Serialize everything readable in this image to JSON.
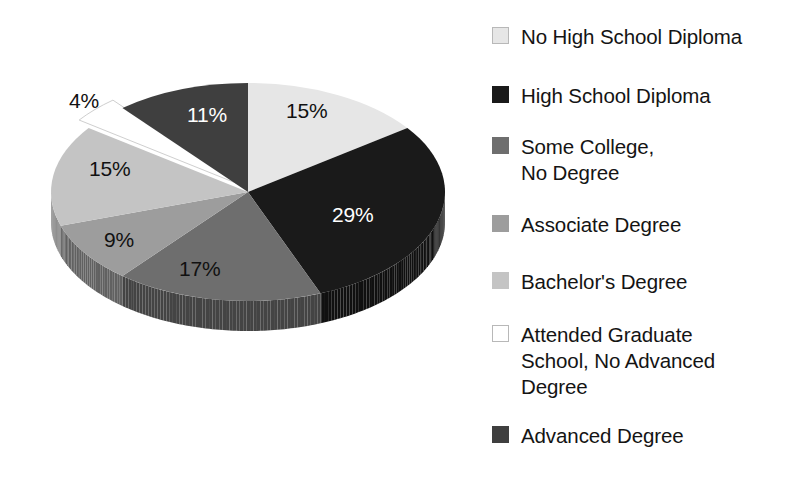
{
  "chart_data": {
    "type": "pie",
    "title": "",
    "subtitle": "",
    "xlabel": "",
    "ylabel": "",
    "grid": false,
    "legend_position": "right",
    "units": "percent",
    "start_angle_deg": 0,
    "direction": "clockwise",
    "three_d": true,
    "categories": [
      "No High School Diploma",
      "High School Diploma",
      "Some College,\nNo Degree",
      "Associate Degree",
      "Bachelor's Degree",
      "Attended Graduate\nSchool, No Advanced\nDegree",
      "Advanced Degree"
    ],
    "values": [
      15,
      29,
      17,
      9,
      15,
      4,
      11
    ],
    "data_labels": [
      "15%",
      "29%",
      "17%",
      "9%",
      "15%",
      "4%",
      "11%"
    ],
    "colors": [
      "#e6e6e6",
      "#1a1a1a",
      "#6e6e6e",
      "#9d9d9d",
      "#c4c4c4",
      "#ffffff",
      "#3f3f3f"
    ],
    "label_text_colors": [
      "#111111",
      "#ffffff",
      "#111111",
      "#111111",
      "#111111",
      "#111111",
      "#ffffff"
    ],
    "exploded_slices": [
      "Attended Graduate\nSchool, No Advanced\nDegree"
    ]
  },
  "pie": {
    "labels": [
      {
        "text": "15%",
        "x": 286,
        "y": 100,
        "tone": "dark"
      },
      {
        "text": "29%",
        "x": 332,
        "y": 204,
        "tone": "light"
      },
      {
        "text": "17%",
        "x": 179,
        "y": 258,
        "tone": "dark"
      },
      {
        "text": "9%",
        "x": 104,
        "y": 229,
        "tone": "dark"
      },
      {
        "text": "15%",
        "x": 89,
        "y": 158,
        "tone": "dark"
      },
      {
        "text": "4%",
        "x": 69,
        "y": 90,
        "tone": "dark"
      },
      {
        "text": "11%",
        "x": 187,
        "y": 104,
        "tone": "light"
      }
    ]
  },
  "legend": {
    "items": [
      {
        "label": "No High School Diploma",
        "color": "#e6e6e6",
        "outlined": true,
        "top": 24
      },
      {
        "label": "High School Diploma",
        "color": "#1a1a1a",
        "outlined": false,
        "top": 83
      },
      {
        "label": "Some College,\nNo Degree",
        "color": "#6e6e6e",
        "outlined": false,
        "top": 134
      },
      {
        "label": "Associate Degree",
        "color": "#9d9d9d",
        "outlined": false,
        "top": 212
      },
      {
        "label": "Bachelor's Degree",
        "color": "#c4c4c4",
        "outlined": false,
        "top": 269
      },
      {
        "label": "Attended Graduate\nSchool, No Advanced\nDegree",
        "color": "#ffffff",
        "outlined": true,
        "top": 322
      },
      {
        "label": "Advanced Degree",
        "color": "#3f3f3f",
        "outlined": false,
        "top": 423
      }
    ]
  }
}
